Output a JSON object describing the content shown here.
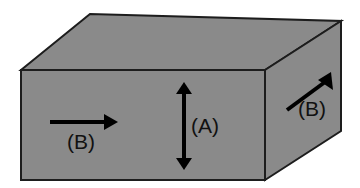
{
  "figure": {
    "background_color": "#ffffff",
    "face_fill_color": "#8a8a8a",
    "edge_color": "#1d1d1d",
    "arrow_color": "#000000",
    "label_color": "#111111"
  },
  "geometry": {
    "front_face": {
      "name": "front-face",
      "points": "21,70 265,70 265,180 21,180"
    },
    "top_face": {
      "name": "top-face",
      "points": "21,70 90,14 341,21 265,70"
    },
    "right_face": {
      "name": "right-face",
      "points": "265,70 341,21 341,131 265,180"
    }
  },
  "annotations": {
    "front_arrow": {
      "label": "(B)",
      "direction": "horizontal-right",
      "label_x": 81,
      "label_y": 143,
      "line": {
        "x1": 50,
        "y1": 122,
        "x2": 104,
        "y2": 122
      },
      "head": "104,114 118,122 104,130"
    },
    "height_arrow": {
      "label": "(A)",
      "direction": "vertical-double",
      "label_x": 205,
      "label_y": 127,
      "line": {
        "x1": 184,
        "y1": 94,
        "x2": 184,
        "y2": 158
      },
      "head_up": "176,94 184,82 192,94",
      "head_down": "176,158 184,170 192,158"
    },
    "side_arrow": {
      "label": "(B)",
      "direction": "diagonal-up-right",
      "label_x": 312,
      "label_y": 110,
      "line": {
        "x1": 287,
        "y1": 110,
        "x2": 325,
        "y2": 82
      },
      "head": "331,72 333,90 318,80"
    }
  }
}
